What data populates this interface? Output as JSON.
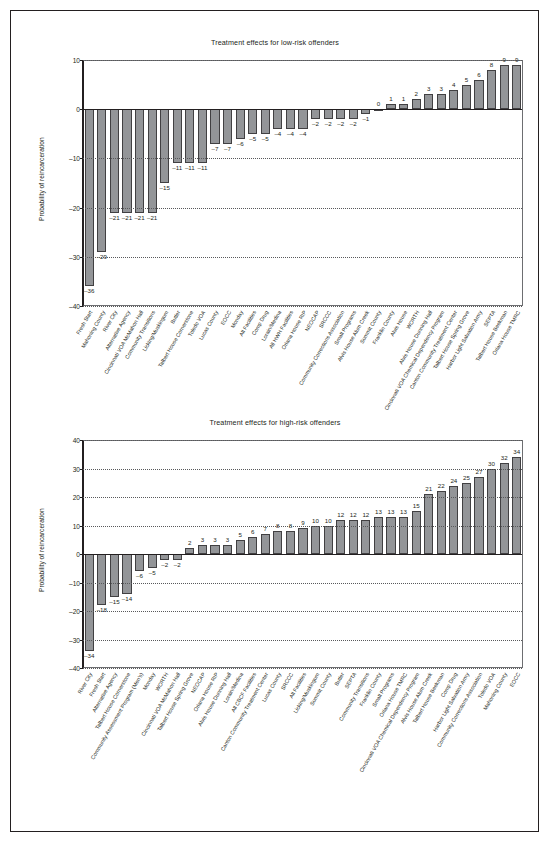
{
  "page": {
    "background": "#ffffff",
    "border_color": "#231f20"
  },
  "colors": {
    "bar_fill": "#939598",
    "bar_stroke": "#414042",
    "axis": "#231f20",
    "grid": "#58595b"
  },
  "charts": [
    {
      "id": "low-risk",
      "title": "Treatment effects for low-risk offenders",
      "ylabel": "Probability of reincarceration"
    },
    {
      "id": "high-risk",
      "title": "Treatment effects for high-risk offenders",
      "ylabel": "Probability of reincarceration"
    }
  ],
  "chart_data": [
    {
      "type": "bar",
      "id": "low-risk",
      "title": "Treatment effects for low-risk offenders",
      "xlabel": "",
      "ylabel": "Probability of reincarceration",
      "ylim": [
        -40,
        10
      ],
      "yticks": [
        10,
        0,
        -10,
        -20,
        -30,
        -40
      ],
      "ytick_labels": [
        "10",
        "0",
        "-10",
        "-20",
        "-30",
        "-40"
      ],
      "grid": true,
      "legend": "none",
      "categories": [
        "Fresh Start",
        "Mahoning County",
        "River City",
        "Alternative Agency",
        "Cincinnati VOA McMahon Hall",
        "Community Transitions",
        "Licking/Muskingum",
        "Butler",
        "Talbert House Cornerstone",
        "Toledo VOA",
        "Lucas County",
        "EOCC",
        "Monday",
        "All Facilities",
        "Comp Drug",
        "Lorain/Medina",
        "All HWH Facilities",
        "Oriana House RIP",
        "NEOCAP",
        "SRCCC",
        "Community Corrections Association",
        "Small Programs",
        "Alvis House Alum Creek",
        "Summit County",
        "Franklin County",
        "Alvis House",
        "WORTH",
        "Alvis House Dunning Hall",
        "Cincinnati VOA Chemical Dependency Program",
        "Canton Community Treatment Center",
        "Talbert House Spring Grove",
        "Harbor Light Salvation Army",
        "SEPTA",
        "Talbert House Beekman",
        "Oriana House TMRC"
      ],
      "values": [
        -36,
        -29,
        -21,
        -21,
        -21,
        -21,
        -15,
        -11,
        -11,
        -11,
        -7,
        -7,
        -6,
        -5,
        -5,
        -4,
        -4,
        -4,
        -2,
        -2,
        -2,
        -2,
        -1,
        0,
        1,
        1,
        2,
        3,
        3,
        4,
        5,
        6,
        8,
        9,
        9
      ],
      "value_labels": [
        "-36",
        "-29",
        "-21",
        "-21",
        "-21",
        "-21",
        "-15",
        "-11",
        "-11",
        "-11",
        "-7",
        "-7",
        "-6",
        "-5",
        "-5",
        "-4",
        "-4",
        "-4",
        "-2",
        "-2",
        "-2",
        "-2",
        "-1",
        "0",
        "1",
        "1",
        "2",
        "3",
        "3",
        "4",
        "5",
        "6",
        "8",
        "9",
        "9"
      ]
    },
    {
      "type": "bar",
      "id": "high-risk",
      "title": "Treatment effects for high-risk offenders",
      "xlabel": "",
      "ylabel": "Probability of reincarceration",
      "ylim": [
        -40,
        40
      ],
      "yticks": [
        40,
        30,
        20,
        10,
        0,
        -10,
        -20,
        -30,
        -40
      ],
      "ytick_labels": [
        "40",
        "30",
        "20",
        "10",
        "0",
        "-10",
        "-20",
        "-30",
        "-40"
      ],
      "grid": true,
      "legend": "none",
      "categories": [
        "River City",
        "Fresh Start",
        "Alternative Agency",
        "Talbert House Cornerstone",
        "Community Assessment Program (Men's)",
        "Monday",
        "WORTH",
        "Cincinnati VOA McMahon Hall",
        "Talbert House Spring Grove",
        "NEOCAP",
        "Oriana House RIP",
        "Alvis House Dunning Hall",
        "Lorain/Medina",
        "All CBCF Facilities",
        "Canton Community Treatment Center",
        "Lucas County",
        "SRCCC",
        "All Facilities",
        "Licking/Muskingum",
        "Summit County",
        "Butler",
        "SEPTA",
        "Community Transitions",
        "Franklin County",
        "Small Programs",
        "Oriana House TMRC",
        "Cincinnati VOA Chemical Dependency Program",
        "Alvis House Alum Creek",
        "Talbert House Beekman",
        "Comp Drug",
        "Harbor Light Salvation Army",
        "Community Corrections Association",
        "Toledo VOA",
        "Mahoning County",
        "EOCC"
      ],
      "values": [
        -34,
        -18,
        -15,
        -14,
        -6,
        -5,
        -2,
        -2,
        2,
        3,
        3,
        3,
        5,
        6,
        7,
        8,
        8,
        9,
        10,
        10,
        12,
        12,
        12,
        13,
        13,
        13,
        15,
        21,
        22,
        24,
        25,
        27,
        30,
        32,
        34
      ],
      "value_labels": [
        "-34",
        "-18",
        "-15",
        "-14",
        "-6",
        "-5",
        "-2",
        "-2",
        "2",
        "3",
        "3",
        "3",
        "5",
        "6",
        "7",
        "8",
        "8",
        "9",
        "10",
        "10",
        "12",
        "12",
        "12",
        "13",
        "13",
        "13",
        "15",
        "21",
        "22",
        "24",
        "25",
        "27",
        "30",
        "32",
        "34"
      ]
    }
  ]
}
